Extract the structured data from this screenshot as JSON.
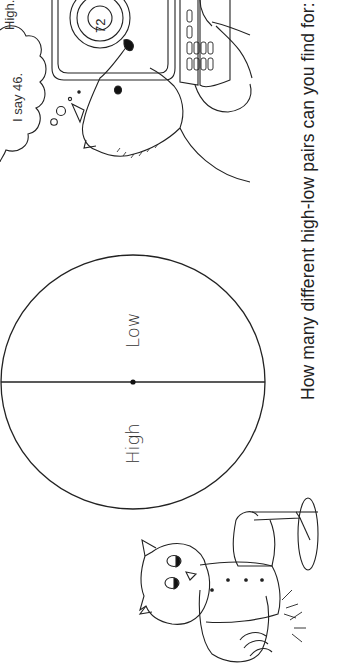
{
  "worksheet": {
    "orientation": "rotated 90° counterclockwise",
    "question": "How many different high-low pairs can you find for:",
    "diagram": {
      "half_labels": {
        "low": "Low",
        "high": "High"
      }
    },
    "thought_bubble": {
      "line1": "High.",
      "line2": "I say 46."
    },
    "calculator_display": "72",
    "illustrations": [
      {
        "name": "dog-at-computer",
        "description": "Dog typing on a keyboard in front of a computer screen showing a target with 72"
      },
      {
        "name": "owl-with-fan",
        "description": "Owl in a vest holding a hand fan"
      }
    ]
  }
}
